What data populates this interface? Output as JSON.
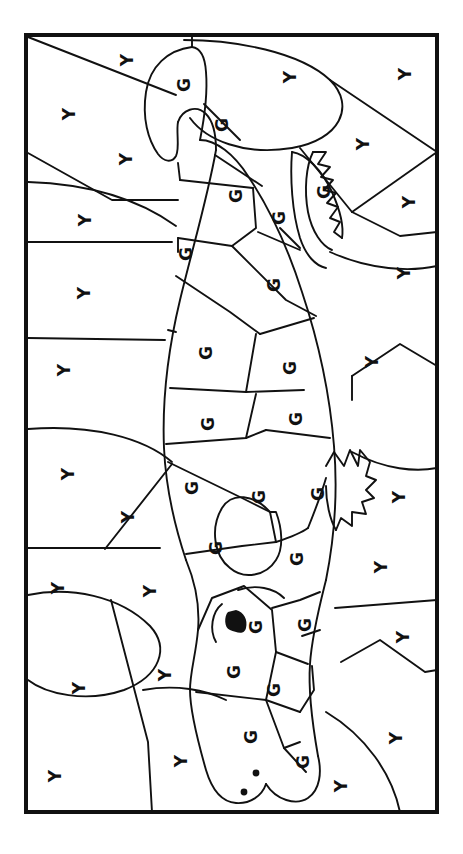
{
  "page": {
    "kind": "color-by-letter-worksheet",
    "orientation": "rotated-90",
    "background_color": "#ffffff",
    "ink_color": "#111111",
    "letter_color": "#111111",
    "border": {
      "x": 26,
      "y": 35,
      "width": 411,
      "height": 777,
      "stroke_width": 4
    }
  },
  "legend": {
    "keys": [
      {
        "letter": "G",
        "meaning": "green",
        "color": "#2e8b34"
      },
      {
        "letter": "Y",
        "meaning": "yellow",
        "color": "#f2c230"
      }
    ]
  },
  "letters": {
    "G": "G",
    "Y": "Y"
  },
  "letter_labels": [
    {
      "id": "g-01",
      "letter": "G",
      "x": 184,
      "y": 85,
      "size": 17,
      "rot": -90
    },
    {
      "id": "g-02",
      "letter": "G",
      "x": 222,
      "y": 125,
      "size": 17,
      "rot": -90
    },
    {
      "id": "g-03",
      "letter": "G",
      "x": 236,
      "y": 196,
      "size": 17,
      "rot": -90
    },
    {
      "id": "g-04",
      "letter": "G",
      "x": 279,
      "y": 218,
      "size": 17,
      "rot": -90
    },
    {
      "id": "g-05",
      "letter": "G",
      "x": 324,
      "y": 192,
      "size": 17,
      "rot": -90
    },
    {
      "id": "g-06",
      "letter": "G",
      "x": 186,
      "y": 254,
      "size": 17,
      "rot": -90
    },
    {
      "id": "g-07",
      "letter": "G",
      "x": 274,
      "y": 285,
      "size": 17,
      "rot": -90
    },
    {
      "id": "g-08",
      "letter": "G",
      "x": 206,
      "y": 353,
      "size": 17,
      "rot": -90
    },
    {
      "id": "g-09",
      "letter": "G",
      "x": 290,
      "y": 368,
      "size": 17,
      "rot": -90
    },
    {
      "id": "g-10",
      "letter": "G",
      "x": 208,
      "y": 424,
      "size": 17,
      "rot": -90
    },
    {
      "id": "g-11",
      "letter": "G",
      "x": 296,
      "y": 419,
      "size": 17,
      "rot": -90
    },
    {
      "id": "g-12",
      "letter": "G",
      "x": 192,
      "y": 488,
      "size": 17,
      "rot": -90
    },
    {
      "id": "g-13",
      "letter": "G",
      "x": 259,
      "y": 497,
      "size": 17,
      "rot": -90
    },
    {
      "id": "g-14",
      "letter": "G",
      "x": 318,
      "y": 494,
      "size": 17,
      "rot": -90
    },
    {
      "id": "g-15",
      "letter": "G",
      "x": 216,
      "y": 548,
      "size": 17,
      "rot": -90
    },
    {
      "id": "g-16",
      "letter": "G",
      "x": 297,
      "y": 559,
      "size": 17,
      "rot": -90
    },
    {
      "id": "g-17",
      "letter": "G",
      "x": 256,
      "y": 627,
      "size": 17,
      "rot": -90
    },
    {
      "id": "g-18",
      "letter": "G",
      "x": 305,
      "y": 625,
      "size": 17,
      "rot": -90
    },
    {
      "id": "g-19",
      "letter": "G",
      "x": 234,
      "y": 672,
      "size": 17,
      "rot": -90
    },
    {
      "id": "g-20",
      "letter": "G",
      "x": 274,
      "y": 690,
      "size": 17,
      "rot": -90
    },
    {
      "id": "g-21",
      "letter": "G",
      "x": 251,
      "y": 737,
      "size": 17,
      "rot": -90
    },
    {
      "id": "g-22",
      "letter": "G",
      "x": 303,
      "y": 762,
      "size": 17,
      "rot": -90
    },
    {
      "id": "y-01",
      "letter": "Y",
      "x": 127,
      "y": 60,
      "size": 17,
      "rot": -90
    },
    {
      "id": "y-02",
      "letter": "Y",
      "x": 290,
      "y": 77,
      "size": 17,
      "rot": -90
    },
    {
      "id": "y-03",
      "letter": "Y",
      "x": 405,
      "y": 74,
      "size": 17,
      "rot": -90
    },
    {
      "id": "y-04",
      "letter": "Y",
      "x": 69,
      "y": 114,
      "size": 17,
      "rot": -90
    },
    {
      "id": "y-05",
      "letter": "Y",
      "x": 363,
      "y": 144,
      "size": 17,
      "rot": -90
    },
    {
      "id": "y-06",
      "letter": "Y",
      "x": 126,
      "y": 159,
      "size": 17,
      "rot": -90
    },
    {
      "id": "y-07",
      "letter": "Y",
      "x": 409,
      "y": 202,
      "size": 17,
      "rot": -90
    },
    {
      "id": "y-08",
      "letter": "Y",
      "x": 85,
      "y": 220,
      "size": 17,
      "rot": -90
    },
    {
      "id": "y-09",
      "letter": "Y",
      "x": 404,
      "y": 273,
      "size": 17,
      "rot": -90
    },
    {
      "id": "y-10",
      "letter": "Y",
      "x": 84,
      "y": 293,
      "size": 17,
      "rot": -90
    },
    {
      "id": "y-11",
      "letter": "Y",
      "x": 372,
      "y": 362,
      "size": 17,
      "rot": -90
    },
    {
      "id": "y-12",
      "letter": "Y",
      "x": 64,
      "y": 370,
      "size": 17,
      "rot": -90
    },
    {
      "id": "y-13",
      "letter": "Y",
      "x": 68,
      "y": 474,
      "size": 17,
      "rot": -90
    },
    {
      "id": "y-14",
      "letter": "Y",
      "x": 128,
      "y": 517,
      "size": 17,
      "rot": -90
    },
    {
      "id": "y-15",
      "letter": "Y",
      "x": 399,
      "y": 497,
      "size": 17,
      "rot": -90
    },
    {
      "id": "y-16",
      "letter": "Y",
      "x": 58,
      "y": 588,
      "size": 17,
      "rot": -90
    },
    {
      "id": "y-17",
      "letter": "Y",
      "x": 150,
      "y": 591,
      "size": 17,
      "rot": -90
    },
    {
      "id": "y-18",
      "letter": "Y",
      "x": 381,
      "y": 567,
      "size": 17,
      "rot": -90
    },
    {
      "id": "y-19",
      "letter": "Y",
      "x": 403,
      "y": 637,
      "size": 17,
      "rot": -90
    },
    {
      "id": "y-20",
      "letter": "Y",
      "x": 79,
      "y": 688,
      "size": 17,
      "rot": -90
    },
    {
      "id": "y-21",
      "letter": "Y",
      "x": 165,
      "y": 675,
      "size": 17,
      "rot": -90
    },
    {
      "id": "y-22",
      "letter": "Y",
      "x": 396,
      "y": 738,
      "size": 17,
      "rot": -90
    },
    {
      "id": "y-23",
      "letter": "Y",
      "x": 55,
      "y": 776,
      "size": 17,
      "rot": -90
    },
    {
      "id": "y-24",
      "letter": "Y",
      "x": 181,
      "y": 761,
      "size": 17,
      "rot": -90
    },
    {
      "id": "y-25",
      "letter": "Y",
      "x": 341,
      "y": 786,
      "size": 17,
      "rot": -90
    }
  ],
  "features": {
    "eye": {
      "cx": 235,
      "cy": 621,
      "r": 9
    },
    "brow": {
      "cx": 222,
      "cy": 622,
      "r": 19
    },
    "nostrils": [
      {
        "cx": 256,
        "cy": 773,
        "r": 3.2
      },
      {
        "cx": 244,
        "cy": 792,
        "r": 3.2
      }
    ]
  }
}
